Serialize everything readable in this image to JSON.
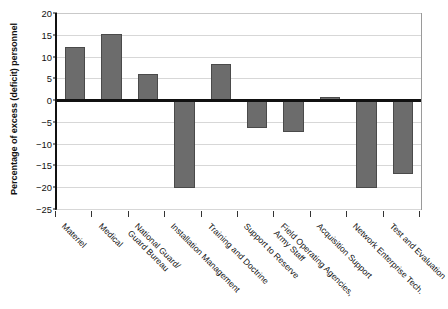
{
  "chart_data": {
    "type": "bar",
    "title": "",
    "subtitle": "",
    "xlabel": "",
    "ylabel": "Percentage of excess (deficit) personnel",
    "ylim": [
      -25,
      20
    ],
    "yticks": [
      20,
      15,
      10,
      5,
      0,
      -5,
      -10,
      -15,
      -20,
      -25
    ],
    "ytick_labels": [
      "20",
      "15",
      "10",
      "5",
      "0",
      "−5",
      "−10",
      "−15",
      "−20",
      "−25"
    ],
    "grid": true,
    "legend": false,
    "legend_position": "none",
    "bar_color": "#6c6c6c",
    "bar_edge_color": "#4a4a4a",
    "gridline_color": "#d7d7d7",
    "zero_line_color": "#111111",
    "background_color": "#ffffff",
    "categories": [
      "Materiel",
      "Medical",
      "National Guard/ Guard Bureau",
      "Installation Management",
      "Training and Doctrine",
      "Support to Reserve",
      "Field Operating Agencies, Army Staff",
      "Acquisition Support",
      "Network Enterprise Tech.",
      "Test and Evaluation"
    ],
    "category_lines": [
      [
        "Materiel",
        ""
      ],
      [
        "Medical",
        ""
      ],
      [
        "National Guard/",
        "Guard Bureau"
      ],
      [
        "Installation Management",
        ""
      ],
      [
        "Training and Doctrine",
        ""
      ],
      [
        "Support to Reserve",
        ""
      ],
      [
        "Field Operating Agencies,",
        "Army Staff"
      ],
      [
        "Acquisition Support",
        ""
      ],
      [
        "Network Enterprise Tech.",
        ""
      ],
      [
        "Test and Evaluation",
        ""
      ]
    ],
    "values": [
      12.2,
      15.1,
      6.1,
      -20.1,
      8.4,
      -6.3,
      -7.3,
      0.8,
      -20.2,
      -17.0
    ]
  }
}
